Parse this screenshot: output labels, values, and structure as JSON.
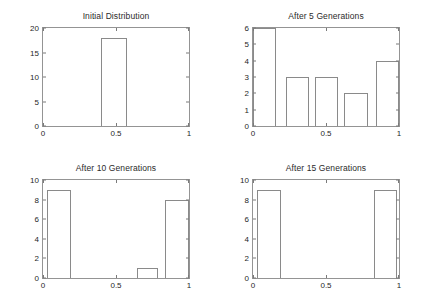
{
  "figure": {
    "background": "#ffffff",
    "axis_color": "#949494",
    "bar_edge_color": "#8a8a8a",
    "text_color": "#1f1f1f"
  },
  "chart_data": [
    {
      "type": "bar",
      "title": "Initial Distribution",
      "xlabel": "",
      "ylabel": "",
      "xlim": [
        0,
        1
      ],
      "ylim": [
        0,
        20
      ],
      "xticks": [
        0,
        0.5,
        1
      ],
      "xticklabels": [
        "0",
        "0.5",
        "1"
      ],
      "yticks": [
        0,
        5,
        10,
        15,
        20
      ],
      "yticklabels": [
        "0",
        "5",
        "10",
        "15",
        "20"
      ],
      "grid": false,
      "legend": null,
      "bars": [
        {
          "left": 0.4,
          "right": 0.575,
          "value": 18
        }
      ]
    },
    {
      "type": "bar",
      "title": "After 5 Generations",
      "xlabel": "",
      "ylabel": "",
      "xlim": [
        0,
        1
      ],
      "ylim": [
        0,
        6
      ],
      "xticks": [
        0,
        0.5,
        1
      ],
      "xticklabels": [
        "0",
        "0.5",
        "1"
      ],
      "yticks": [
        0,
        1,
        2,
        3,
        4,
        5,
        6
      ],
      "yticklabels": [
        "0",
        "1",
        "2",
        "3",
        "4",
        "5",
        "6"
      ],
      "grid": false,
      "legend": null,
      "bars": [
        {
          "left": 0.0,
          "right": 0.155,
          "value": 6
        },
        {
          "left": 0.225,
          "right": 0.385,
          "value": 3
        },
        {
          "left": 0.425,
          "right": 0.585,
          "value": 3
        },
        {
          "left": 0.625,
          "right": 0.785,
          "value": 2
        },
        {
          "left": 0.845,
          "right": 1.0,
          "value": 4
        }
      ]
    },
    {
      "type": "bar",
      "title": "After 10 Generations",
      "xlabel": "",
      "ylabel": "",
      "xlim": [
        0,
        1
      ],
      "ylim": [
        0,
        10
      ],
      "xticks": [
        0,
        0.5,
        1
      ],
      "xticklabels": [
        "0",
        "0.5",
        "1"
      ],
      "yticks": [
        0,
        2,
        4,
        6,
        8,
        10
      ],
      "yticklabels": [
        "0",
        "2",
        "4",
        "6",
        "8",
        "10"
      ],
      "grid": false,
      "legend": null,
      "bars": [
        {
          "left": 0.025,
          "right": 0.19,
          "value": 9
        },
        {
          "left": 0.645,
          "right": 0.79,
          "value": 1
        },
        {
          "left": 0.835,
          "right": 1.0,
          "value": 8
        }
      ]
    },
    {
      "type": "bar",
      "title": "After 15 Generations",
      "xlabel": "",
      "ylabel": "",
      "xlim": [
        0,
        1
      ],
      "ylim": [
        0,
        10
      ],
      "xticks": [
        0,
        0.5,
        1
      ],
      "xticklabels": [
        "0",
        "0.5",
        "1"
      ],
      "yticks": [
        0,
        2,
        4,
        6,
        8,
        10
      ],
      "yticklabels": [
        "0",
        "2",
        "4",
        "6",
        "8",
        "10"
      ],
      "grid": false,
      "legend": null,
      "bars": [
        {
          "left": 0.03,
          "right": 0.19,
          "value": 9
        },
        {
          "left": 0.83,
          "right": 0.985,
          "value": 9
        }
      ]
    }
  ]
}
